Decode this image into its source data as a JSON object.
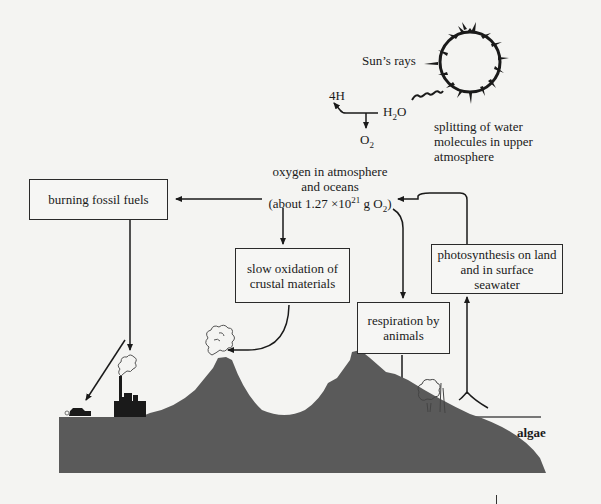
{
  "diagram": {
    "sun": {
      "label": "Sun’s rays",
      "icon": "sun-icon"
    },
    "water_splitting": {
      "products_h": "4H",
      "reactant": "H",
      "reactant_sub": "2",
      "reactant_tail": "O",
      "product_o": "O",
      "product_o_sub": "2",
      "caption_lines": [
        "splitting of water",
        "molecules in upper",
        "atmosphere"
      ]
    },
    "reservoir": {
      "line1": "oxygen in atmosphere",
      "line2": "and oceans",
      "line3_prefix": "(about 1.27 ×10",
      "line3_exp": "21",
      "line3_unit": " g O",
      "line3_sub": "2",
      "line3_suffix": ")"
    },
    "boxes": {
      "burning": {
        "lines": [
          "burning fossil fuels"
        ]
      },
      "oxidation": {
        "lines": [
          "slow oxidation of",
          "crustal materials"
        ]
      },
      "respiration": {
        "lines": [
          "respiration by",
          "animals"
        ]
      },
      "photosynthesis": {
        "lines": [
          "photosynthesis on land",
          "and in surface",
          "seawater"
        ]
      }
    },
    "landscape": {
      "water_label": "algae",
      "land_color": "#5a5a5a",
      "icons": [
        "car-icon",
        "factory-icon",
        "volcano-icon",
        "tree-icon",
        "algae-icon"
      ]
    }
  }
}
